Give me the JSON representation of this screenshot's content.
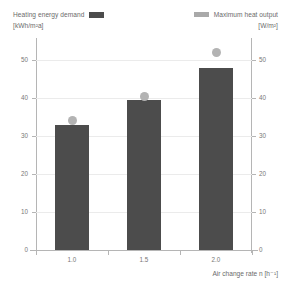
{
  "legend": {
    "left": {
      "label": "Heating energy demand",
      "units": "[kWh/m²a]",
      "swatch": "bar-swatch",
      "color": "#4c4c4c"
    },
    "right": {
      "label": "Maximum heat output",
      "units": "[W/m²]",
      "swatch": "dot-swatch",
      "color": "#b3b3b3"
    }
  },
  "chart_data": {
    "type": "bar",
    "title": "",
    "subtitle": "",
    "xlabel": "Air change rate n [h⁻¹]",
    "ylabel": "",
    "categories": [
      "1.0",
      "1.5",
      "2.0"
    ],
    "grid": true,
    "legend_position": "top",
    "axes": {
      "left": {
        "label": "Heating energy demand [kWh/m²a]",
        "ticks": [
          0,
          10,
          20,
          30,
          40,
          50
        ],
        "tick_labels": [
          "0",
          "10",
          "20",
          "30",
          "40",
          "50"
        ],
        "ylim": [
          0,
          55
        ]
      },
      "right": {
        "label": "Maximum heat output [W/m²]",
        "ticks": [
          0,
          10,
          20,
          30,
          40,
          50
        ],
        "tick_labels": [
          "0",
          "10",
          "20",
          "30",
          "40",
          "50"
        ],
        "ylim": [
          0,
          55
        ]
      }
    },
    "series": [
      {
        "name": "Heating energy demand",
        "kind": "bar",
        "axis": "left",
        "unit": "kWh/m²a",
        "color": "#4c4c4c",
        "values": [
          33,
          39.5,
          48
        ]
      },
      {
        "name": "Maximum heat output",
        "kind": "scatter",
        "axis": "right",
        "unit": "W/m²",
        "color": "#b3b3b3",
        "values": [
          34,
          40.5,
          52
        ]
      }
    ]
  }
}
